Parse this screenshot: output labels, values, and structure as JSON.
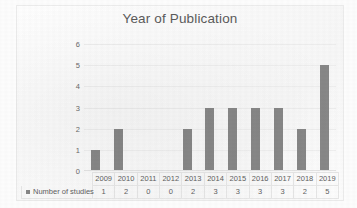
{
  "chart_data": {
    "type": "bar",
    "title": "Year of Publication",
    "xlabel": "",
    "ylabel": "",
    "ylim": [
      0,
      6
    ],
    "yticks": [
      0,
      1,
      2,
      3,
      4,
      5,
      6
    ],
    "grid": true,
    "legend_position": "bottom-table",
    "categories": [
      "2009",
      "2010",
      "2011",
      "2012",
      "2013",
      "2014",
      "2015",
      "2016",
      "2017",
      "2018",
      "2019"
    ],
    "series": [
      {
        "name": "Number of studies",
        "values": [
          1,
          2,
          0,
          0,
          2,
          3,
          3,
          3,
          3,
          2,
          5
        ],
        "color": "#878787"
      }
    ]
  },
  "data_table": {
    "row_label": "Number of studies",
    "header": [
      "2009",
      "2010",
      "2011",
      "2012",
      "2013",
      "2014",
      "2015",
      "2016",
      "2017",
      "2018",
      "2019"
    ],
    "values": [
      "1",
      "2",
      "0",
      "0",
      "2",
      "3",
      "3",
      "3",
      "3",
      "2",
      "5"
    ]
  },
  "colors": {
    "bar": "#878787",
    "title_text": "#5a5a5a",
    "axis_text": "#6b6b6b",
    "gridline": "#eeeeee",
    "table_border": "#e6e6e6",
    "background": "#fdfdfd"
  }
}
